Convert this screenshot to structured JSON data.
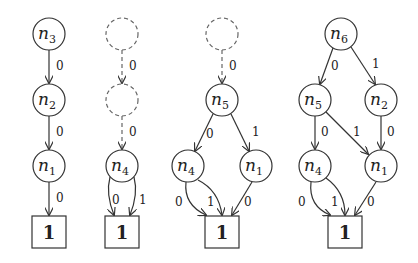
{
  "colors": {
    "stroke": "#333333",
    "dashed": "#666666",
    "text": "#222222",
    "background": "#ffffff"
  },
  "diagrams": [
    {
      "id": "d1",
      "nodes": [
        {
          "id": "n3",
          "name": "n",
          "sub": "3",
          "x": 49,
          "y": 34,
          "type": "circle"
        },
        {
          "id": "n2",
          "name": "n",
          "sub": "2",
          "x": 49,
          "y": 100,
          "type": "circle"
        },
        {
          "id": "n1",
          "name": "n",
          "sub": "1",
          "x": 49,
          "y": 166,
          "type": "circle"
        },
        {
          "id": "t",
          "name": "1",
          "x": 49,
          "y": 232,
          "type": "terminal"
        }
      ],
      "edges": [
        {
          "from": "n3",
          "to": "n2",
          "label": "0",
          "style": "solid",
          "path": "M49,50 L49,83",
          "lx": 56,
          "ly": 70
        },
        {
          "from": "n2",
          "to": "n1",
          "label": "0",
          "style": "solid",
          "path": "M49,116 L49,149",
          "lx": 56,
          "ly": 136
        },
        {
          "from": "n1",
          "to": "t",
          "label": "0",
          "style": "solid",
          "path": "M49,182 L49,215",
          "lx": 56,
          "ly": 202
        }
      ]
    },
    {
      "id": "d2",
      "nodes": [
        {
          "id": "a",
          "name": "",
          "sub": "",
          "x": 122,
          "y": 34,
          "type": "dashed"
        },
        {
          "id": "b",
          "name": "",
          "sub": "",
          "x": 122,
          "y": 100,
          "type": "dashed"
        },
        {
          "id": "n4",
          "name": "n",
          "sub": "4",
          "x": 122,
          "y": 166,
          "type": "circle"
        },
        {
          "id": "t",
          "name": "1",
          "x": 122,
          "y": 232,
          "type": "terminal"
        }
      ],
      "edges": [
        {
          "from": "a",
          "to": "b",
          "label": "0",
          "style": "dashed",
          "path": "M122,50 L122,83",
          "lx": 129,
          "ly": 70
        },
        {
          "from": "b",
          "to": "n4",
          "label": "0",
          "style": "dashed",
          "path": "M122,116 L122,149",
          "lx": 129,
          "ly": 136
        },
        {
          "from": "n4",
          "to": "t",
          "label": "0",
          "style": "solid",
          "path": "M110,177 C106,192 110,205 114,215",
          "lx": 112,
          "ly": 204
        },
        {
          "from": "n4",
          "to": "t",
          "label": "1",
          "style": "solid",
          "path": "M134,177 C138,192 134,205 130,215",
          "lx": 139,
          "ly": 204
        }
      ]
    },
    {
      "id": "d3",
      "nodes": [
        {
          "id": "a",
          "name": "",
          "sub": "",
          "x": 222,
          "y": 34,
          "type": "dashed"
        },
        {
          "id": "n5",
          "name": "n",
          "sub": "5",
          "x": 222,
          "y": 100,
          "type": "circle"
        },
        {
          "id": "n4",
          "name": "n",
          "sub": "4",
          "x": 188,
          "y": 166,
          "type": "circle"
        },
        {
          "id": "n1",
          "name": "n",
          "sub": "1",
          "x": 256,
          "y": 166,
          "type": "circle"
        },
        {
          "id": "t",
          "name": "1",
          "x": 222,
          "y": 232,
          "type": "terminal"
        }
      ],
      "edges": [
        {
          "from": "a",
          "to": "n5",
          "label": "0",
          "style": "dashed",
          "path": "M222,50 L222,83",
          "lx": 229,
          "ly": 70
        },
        {
          "from": "n5",
          "to": "n4",
          "label": "0",
          "style": "solid",
          "path": "M213,114 L195,151",
          "lx": 206,
          "ly": 138
        },
        {
          "from": "n5",
          "to": "n1",
          "label": "1",
          "style": "solid",
          "path": "M231,114 L249,151",
          "lx": 252,
          "ly": 136
        },
        {
          "from": "n4",
          "to": "t",
          "label": "0",
          "style": "solid",
          "path": "M186,182 C184,200 195,210 206,215",
          "lx": 175,
          "ly": 206
        },
        {
          "from": "n4",
          "to": "t",
          "label": "1",
          "style": "solid",
          "path": "M198,180 C214,188 220,200 222,215",
          "lx": 207,
          "ly": 206
        },
        {
          "from": "n1",
          "to": "t",
          "label": "0",
          "style": "solid",
          "path": "M252,182 L232,215",
          "lx": 244,
          "ly": 206
        }
      ]
    },
    {
      "id": "d4",
      "nodes": [
        {
          "id": "n6",
          "name": "n",
          "sub": "6",
          "x": 341,
          "y": 34,
          "type": "circle"
        },
        {
          "id": "n5",
          "name": "n",
          "sub": "5",
          "x": 315,
          "y": 100,
          "type": "circle"
        },
        {
          "id": "n2",
          "name": "n",
          "sub": "2",
          "x": 381,
          "y": 100,
          "type": "circle"
        },
        {
          "id": "n4",
          "name": "n",
          "sub": "4",
          "x": 315,
          "y": 166,
          "type": "circle"
        },
        {
          "id": "n1",
          "name": "n",
          "sub": "1",
          "x": 381,
          "y": 166,
          "type": "circle"
        },
        {
          "id": "t",
          "name": "1",
          "x": 345,
          "y": 232,
          "type": "terminal"
        }
      ],
      "edges": [
        {
          "from": "n6",
          "to": "n5",
          "label": "0",
          "style": "solid",
          "path": "M333,48 L320,84",
          "lx": 331,
          "ly": 70
        },
        {
          "from": "n6",
          "to": "n2",
          "label": "1",
          "style": "solid",
          "path": "M351,47 L375,84",
          "lx": 372,
          "ly": 68
        },
        {
          "from": "n5",
          "to": "n4",
          "label": "0",
          "style": "solid",
          "path": "M315,116 L315,149",
          "lx": 321,
          "ly": 136
        },
        {
          "from": "n5",
          "to": "n1",
          "label": "1",
          "style": "solid",
          "path": "M326,112 L368,154",
          "lx": 353,
          "ly": 136
        },
        {
          "from": "n2",
          "to": "n1",
          "label": "0",
          "style": "solid",
          "path": "M381,116 L381,149",
          "lx": 387,
          "ly": 136
        },
        {
          "from": "n4",
          "to": "t",
          "label": "0",
          "style": "solid",
          "path": "M311,182 C309,200 318,210 330,215",
          "lx": 298,
          "ly": 206
        },
        {
          "from": "n4",
          "to": "t",
          "label": "1",
          "style": "solid",
          "path": "M326,178 C340,188 345,200 345,215",
          "lx": 331,
          "ly": 206
        },
        {
          "from": "n1",
          "to": "t",
          "label": "0",
          "style": "solid",
          "path": "M376,182 L355,215",
          "lx": 367,
          "ly": 206
        }
      ]
    }
  ]
}
